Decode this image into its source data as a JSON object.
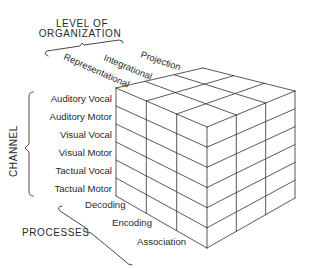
{
  "diagram": {
    "level_of_organization": {
      "title_line1": "LEVEL OF",
      "title_line2": "ORGANIZATION",
      "levels": [
        "Representational",
        "Integrational",
        "Projection"
      ]
    },
    "channel": {
      "title": "CHANNEL",
      "items": [
        "Auditory Vocal",
        "Auditory Motor",
        "Visual Vocal",
        "Visual Motor",
        "Tactual Vocal",
        "Tactual Motor"
      ]
    },
    "processes": {
      "title": "PROCESSES",
      "items": [
        "Decoding",
        "Encoding",
        "Association"
      ]
    },
    "cube": {
      "rows": 6,
      "left_face_columns": 3,
      "right_face_columns": 3,
      "line_color": "#2e2e2e",
      "background": "#ffffff"
    }
  }
}
